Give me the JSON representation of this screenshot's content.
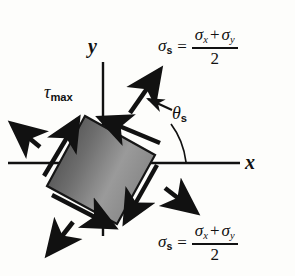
{
  "figure": {
    "background_color": "#fdfdfb",
    "ink_color": "#111111"
  },
  "axes": {
    "x_label": "x",
    "y_label": "y",
    "x_axis": {
      "x1": 8,
      "y1": 163,
      "x2": 240,
      "y2": 163
    },
    "y_axis": {
      "x1": 103,
      "y1": 62,
      "x2": 103,
      "y2": 236
    }
  },
  "element": {
    "name": "rotated-stress-element",
    "rotation_degrees": 20,
    "fill_gradient_dark": "#4f4f4f",
    "fill_gradient_mid": "#8e8e8e",
    "fill_gradient_light": "#a6a6a6",
    "stroke_color": "#161616",
    "corners": [
      {
        "x": 85,
        "y": 116
      },
      {
        "x": 155,
        "y": 155
      },
      {
        "x": 117,
        "y": 224
      },
      {
        "x": 47,
        "y": 186
      }
    ]
  },
  "labels": {
    "tau_max": {
      "symbol": "τ",
      "subscript": "max"
    },
    "theta_s": {
      "symbol": "θ",
      "subscript": "s"
    },
    "sigma_s_top": {
      "lhs_symbol": "σ",
      "lhs_subscript": "s",
      "equals": "=",
      "numerator_first": "σ",
      "numerator_first_sub": "x",
      "numerator_operator": "+",
      "numerator_second": "σ",
      "numerator_second_sub": "y",
      "denominator": "2"
    },
    "sigma_s_bottom": {
      "lhs_symbol": "σ",
      "lhs_subscript": "s",
      "equals": "=",
      "numerator_first": "σ",
      "numerator_first_sub": "x",
      "numerator_operator": "+",
      "numerator_second": "σ",
      "numerator_second_sub": "y",
      "denominator": "2"
    }
  },
  "arrows": {
    "shear_arrows": [
      {
        "name": "shear-upper-left-face",
        "direction": "up-right",
        "description": "tau max along upper-left edge"
      },
      {
        "name": "shear-upper-right-face",
        "direction": "left",
        "description": "tau max along upper-right edge"
      },
      {
        "name": "shear-lower-right-face",
        "direction": "down",
        "description": "tau max along lower-right edge"
      },
      {
        "name": "shear-lower-left-face",
        "direction": "down-right",
        "description": "tau max along lower-left edge"
      }
    ],
    "normal_arrows": [
      {
        "name": "sigma-upper-left",
        "direction": "up-left"
      },
      {
        "name": "sigma-upper-right",
        "direction": "up-right"
      },
      {
        "name": "sigma-lower-right",
        "direction": "down-right"
      },
      {
        "name": "sigma-lower-left",
        "direction": "down-left"
      }
    ],
    "leader_lines": [
      {
        "name": "theta-s-leader-arrow",
        "description": "arrow from theta-s label to upper-right normal arrow"
      },
      {
        "name": "theta-s-angle-arc",
        "description": "arc from x-axis to theta-s label"
      }
    ]
  }
}
